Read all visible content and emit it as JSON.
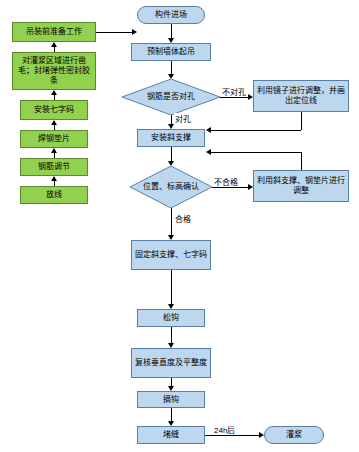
{
  "diagram": {
    "colors": {
      "green_fill": "#92d050",
      "blue_fill": "#bdd7ee",
      "line": "#000000"
    },
    "nodes": {
      "prep_work": "吊装前准备工作",
      "grout_area": "对灌浆区域进行凿毛；封堵弹性密封胶条",
      "install_seven": "安装七字码",
      "weld_shim": "焊钢垫片",
      "rebar_adjust": "钢筋调节",
      "layout_line": "放线",
      "component_entry": "构件进场",
      "precast_lift": "预制墙体起吊",
      "rebar_hole_check": "钢筋是否对孔",
      "mirror_adjust": "利用镜子进行调整，并画出定位线",
      "install_brace": "安装斜支撑",
      "position_check": "位置、标高确认",
      "brace_shim_adjust": "利用斜支撑、钢垫片进行调整",
      "fix_brace": "固定斜支撑、七字码",
      "loosen_hook": "松钩",
      "recheck": "复核垂直度及平整度",
      "remove_hook": "摘钩",
      "seal_joint": "堵缝",
      "grouting": "灌浆"
    },
    "edge_labels": {
      "not_aligned": "不对孔",
      "aligned": "对孔",
      "unqualified": "不合格",
      "qualified": "合格",
      "after_24h": "24h后"
    }
  }
}
